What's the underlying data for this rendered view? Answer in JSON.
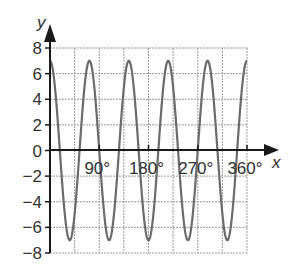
{
  "chart_data": {
    "type": "line",
    "title": "",
    "function": "y = 7 cos(5x)",
    "xlabel": "x",
    "ylabel": "y",
    "xlim": [
      0,
      360
    ],
    "ylim": [
      -8,
      8
    ],
    "grid": true,
    "legend": null,
    "x_ticks": [
      90,
      180,
      270,
      360
    ],
    "x_tick_labels": [
      "90°",
      "180°",
      "270°",
      "360°"
    ],
    "y_ticks": [
      8,
      6,
      4,
      2,
      0,
      -2,
      -4,
      -6,
      -8
    ],
    "y_tick_labels": [
      "8",
      "6",
      "4",
      "2",
      "0",
      "−2",
      "−4",
      "−6",
      "−8"
    ],
    "x_grid_step": 45,
    "y_grid_step": 2,
    "series": [
      {
        "name": "y = 7cos(5x)",
        "amplitude": 7,
        "period_deg": 72,
        "x": [
          0,
          36,
          72,
          108,
          144,
          180,
          216,
          252,
          288,
          324,
          360
        ],
        "values": [
          7,
          -7,
          7,
          -7,
          7,
          -7,
          7,
          -7,
          7,
          -7,
          7
        ]
      }
    ],
    "colors": {
      "curve": "#6b6b6b",
      "axis": "#1a1a1a",
      "grid": "#9a9a9a"
    }
  }
}
